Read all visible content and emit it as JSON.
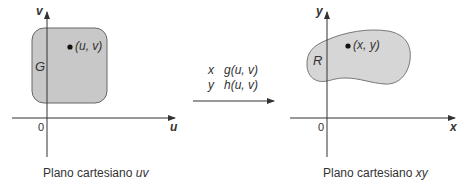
{
  "left_panel": {
    "axis_h_label": "u",
    "axis_v_label": "v",
    "origin_label": "0",
    "region_label": "G",
    "point_label": "(u, v)",
    "caption_prefix": "Plano cartesiano ",
    "caption_var": "uv",
    "region_color": "#c8c8c8"
  },
  "transform": {
    "line1_var": "x",
    "line1_expr": "g(u, v)",
    "line2_var": "y",
    "line2_expr": "h(u, v)"
  },
  "right_panel": {
    "axis_h_label": "x",
    "axis_v_label": "y",
    "origin_label": "0",
    "region_label": "R",
    "point_label": "(x, y)",
    "caption_prefix": "Plano cartesiano ",
    "caption_var": "xy",
    "region_color": "#d6d6d6"
  }
}
